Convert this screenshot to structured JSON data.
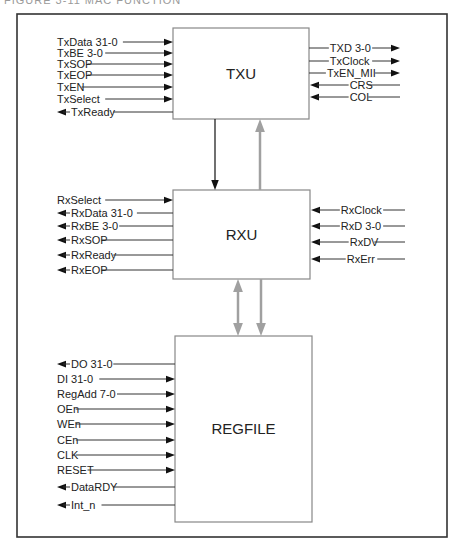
{
  "caption": "FIGURE 3-11   MAC FUNCTION",
  "colors": {
    "frame": "#333333",
    "box": "#888888",
    "wire": "#333333",
    "arrow": "#111111",
    "bus": "#a0a0a0"
  },
  "blocks": [
    {
      "id": "txu",
      "label": "TXU",
      "x": 173,
      "y": 28,
      "w": 136,
      "h": 91
    },
    {
      "id": "rxu",
      "label": "RXU",
      "x": 173,
      "y": 190,
      "w": 137,
      "h": 89
    },
    {
      "id": "regfile",
      "label": "REGFILE",
      "x": 175,
      "y": 336,
      "w": 137,
      "h": 186
    }
  ],
  "signals": {
    "txu_left": [
      {
        "label": "TxData 31-0",
        "dir": "in",
        "y": 42
      },
      {
        "label": "TxBE 3-0",
        "dir": "in",
        "y": 53
      },
      {
        "label": "TxSOP",
        "dir": "in",
        "y": 64
      },
      {
        "label": "TxEOP",
        "dir": "in",
        "y": 75
      },
      {
        "label": "TxEN",
        "dir": "in",
        "y": 87
      },
      {
        "label": "TxSelect",
        "dir": "in",
        "y": 99
      },
      {
        "label": "TxReady",
        "dir": "out",
        "y": 112
      }
    ],
    "txu_right": [
      {
        "label": "TXD 3-0",
        "dir": "out",
        "y": 48
      },
      {
        "label": "TxClock",
        "dir": "out",
        "y": 61
      },
      {
        "label": "TxEN_MII",
        "dir": "out",
        "y": 73
      },
      {
        "label": "CRS",
        "dir": "in",
        "y": 85
      },
      {
        "label": "COL",
        "dir": "in",
        "y": 97
      }
    ],
    "rxu_left": [
      {
        "label": "RxSelect",
        "dir": "in",
        "y": 200
      },
      {
        "label": "RxData 31-0",
        "dir": "out",
        "y": 213
      },
      {
        "label": "RxBE 3-0",
        "dir": "out",
        "y": 226
      },
      {
        "label": "RxSOP",
        "dir": "out",
        "y": 240
      },
      {
        "label": "RxReady",
        "dir": "out",
        "y": 255
      },
      {
        "label": "RxEOP",
        "dir": "out",
        "y": 270
      }
    ],
    "rxu_right": [
      {
        "label": "RxClock",
        "dir": "in",
        "y": 210
      },
      {
        "label": "RxD 3-0",
        "dir": "in",
        "y": 226
      },
      {
        "label": "RxDV",
        "dir": "in",
        "y": 242
      },
      {
        "label": "RxErr",
        "dir": "in",
        "y": 259
      }
    ],
    "regfile_left": [
      {
        "label": "DO 31-0",
        "dir": "out",
        "y": 364
      },
      {
        "label": "DI 31-0",
        "dir": "in",
        "y": 379
      },
      {
        "label": "RegAdd 7-0",
        "dir": "in",
        "y": 394
      },
      {
        "label": "OEn",
        "dir": "in",
        "y": 409
      },
      {
        "label": "WEn",
        "dir": "in",
        "y": 424
      },
      {
        "label": "CEn",
        "dir": "in",
        "y": 440
      },
      {
        "label": "CLK",
        "dir": "in",
        "y": 455
      },
      {
        "label": "RESET",
        "dir": "in",
        "y": 470
      },
      {
        "label": "DataRDY",
        "dir": "out",
        "y": 487
      },
      {
        "label": "Int_n",
        "dir": "out",
        "y": 505
      }
    ]
  },
  "connections": [
    {
      "from": "txu",
      "to": "rxu",
      "style": "black",
      "type": "down",
      "x": 215,
      "y1": 119,
      "y2": 190
    },
    {
      "from": "rxu",
      "to": "txu",
      "style": "gray",
      "type": "up",
      "x": 260,
      "y1": 190,
      "y2": 119
    },
    {
      "from": "rxu",
      "to": "regfile",
      "style": "gray",
      "type": "bidirectional",
      "x": 238,
      "y1": 279,
      "y2": 336
    },
    {
      "from": "rxu",
      "to": "regfile",
      "style": "gray",
      "type": "down",
      "x": 261,
      "y1": 279,
      "y2": 336
    }
  ]
}
